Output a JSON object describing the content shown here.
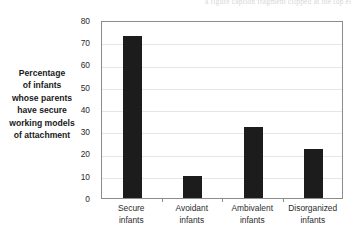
{
  "figure": {
    "top_caption": "a figure caption fragment clipped at the top edge"
  },
  "axis": {
    "y_label_lines": [
      "Percentage",
      "of infants",
      "whose parents",
      "have secure",
      "working models",
      "of attachment"
    ],
    "y_ticks": [
      "80",
      "70",
      "60",
      "50",
      "40",
      "30",
      "20",
      "10",
      "0"
    ]
  },
  "chart_data": {
    "type": "bar",
    "title": "",
    "xlabel": "",
    "ylabel": "Percentage of infants whose parents have secure working models of attachment",
    "categories": [
      "Secure infants",
      "Avoidant infants",
      "Ambivalent infants",
      "Disorganized infants"
    ],
    "category_lines": [
      [
        "Secure",
        "infants"
      ],
      [
        "Avoidant",
        "infants"
      ],
      [
        "Ambivalent",
        "infants"
      ],
      [
        "Disorganized",
        "infants"
      ]
    ],
    "values": [
      73,
      10,
      32,
      22
    ],
    "ylim": [
      0,
      80
    ],
    "ytick_step": 10,
    "grid": true,
    "legend": "none",
    "bar_color": "#1c1c1c",
    "grid_color": "#e6e6e6",
    "axis_color": "#8c8c8c"
  }
}
